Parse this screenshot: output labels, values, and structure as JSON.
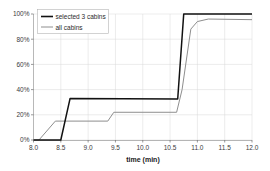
{
  "chart_data": {
    "type": "line",
    "title": "",
    "xlabel": "time (min)",
    "ylabel": "",
    "xlim": [
      8.0,
      12.0
    ],
    "ylim": [
      0,
      100
    ],
    "grid": true,
    "legend_position": "upper-left-inside",
    "xticks": [
      "8.0",
      "8.5",
      "9.0",
      "9.5",
      "10.0",
      "10.5",
      "11.0",
      "11.5",
      "12.0"
    ],
    "xtick_values": [
      8.0,
      8.5,
      9.0,
      9.5,
      10.0,
      10.5,
      11.0,
      11.5,
      12.0
    ],
    "yticks": [
      "0%",
      "20%",
      "40%",
      "60%",
      "80%",
      "100%"
    ],
    "ytick_values": [
      0,
      20,
      40,
      60,
      80,
      100
    ],
    "series": [
      {
        "name": "selected 3 cabins",
        "color": "#111111",
        "width": 1.5,
        "x": [
          8.0,
          8.5,
          8.67,
          10.64,
          10.75,
          12.0
        ],
        "values": [
          0,
          0,
          33,
          32.5,
          100,
          100
        ]
      },
      {
        "name": "all cabins",
        "color": "#8e8e8e",
        "width": 1.0,
        "x": [
          8.0,
          8.1,
          8.4,
          9.36,
          9.47,
          10.62,
          10.72,
          10.88,
          11.0,
          11.2,
          12.0
        ],
        "values": [
          0,
          0,
          15,
          15,
          22,
          22,
          40,
          88,
          94,
          96,
          95.5
        ]
      }
    ],
    "legend": [
      {
        "label": "selected 3 cabins",
        "style": "thick-black-line"
      },
      {
        "label": "all cabins",
        "style": "thin-gray-line"
      }
    ]
  }
}
